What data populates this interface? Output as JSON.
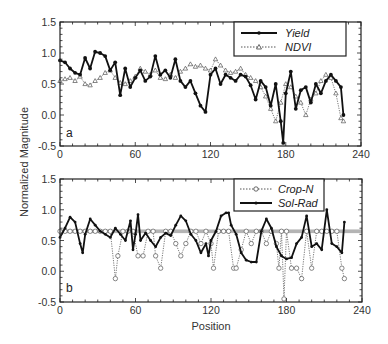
{
  "figure": {
    "ylabel": "Normalized Magnitude",
    "xlabel": "Position"
  },
  "chart_data": [
    {
      "type": "line",
      "panel_label": "a",
      "xlabel": "",
      "ylabel": "Normalized Magnitude",
      "xlim": [
        0,
        240
      ],
      "ylim": [
        -0.5,
        1.5
      ],
      "xticks": [
        "0",
        "60",
        "120",
        "180",
        "240"
      ],
      "yticks": [
        "1.5",
        "1.0",
        "0.5",
        "0.0",
        "-0.5"
      ],
      "grid": false,
      "legend_position": "upper right",
      "series": [
        {
          "name": "Yield",
          "style": "solid",
          "marker": "filled-circle",
          "color": "#111111",
          "x": [
            0,
            4,
            8,
            12,
            16,
            20,
            24,
            28,
            32,
            36,
            40,
            44,
            48,
            52,
            56,
            60,
            64,
            68,
            72,
            76,
            80,
            84,
            88,
            92,
            96,
            100,
            104,
            108,
            112,
            116,
            120,
            124,
            128,
            132,
            136,
            140,
            144,
            148,
            152,
            156,
            160,
            164,
            168,
            172,
            176,
            178,
            180,
            184,
            188,
            192,
            196,
            200,
            204,
            208,
            212,
            216,
            220,
            224,
            226
          ],
          "values": [
            0.88,
            0.85,
            0.75,
            0.68,
            0.65,
            0.92,
            0.75,
            1.02,
            1.0,
            0.95,
            0.72,
            0.85,
            0.32,
            0.75,
            0.45,
            0.6,
            0.72,
            0.55,
            0.62,
            0.95,
            0.65,
            0.72,
            0.6,
            0.9,
            0.55,
            0.45,
            0.55,
            0.35,
            0.15,
            0.05,
            0.65,
            0.75,
            0.5,
            0.65,
            0.6,
            0.55,
            0.65,
            0.62,
            0.48,
            0.25,
            0.55,
            0.45,
            0.15,
            0.5,
            -0.1,
            -0.45,
            0.35,
            0.7,
            0.1,
            0.4,
            0.45,
            0.2,
            0.5,
            0.35,
            0.55,
            0.65,
            0.55,
            0.45,
            0.0
          ]
        },
        {
          "name": "NDVI",
          "style": "dotted",
          "marker": "open-triangle",
          "color": "#555555",
          "x": [
            0,
            4,
            8,
            12,
            16,
            20,
            24,
            28,
            32,
            36,
            40,
            44,
            48,
            52,
            56,
            60,
            64,
            68,
            72,
            76,
            80,
            84,
            88,
            92,
            96,
            100,
            104,
            108,
            112,
            116,
            120,
            124,
            128,
            132,
            136,
            140,
            144,
            148,
            152,
            156,
            160,
            164,
            168,
            172,
            176,
            180,
            184,
            188,
            192,
            196,
            200,
            204,
            208,
            212,
            216,
            220,
            224,
            226
          ],
          "values": [
            0.55,
            0.58,
            0.6,
            0.55,
            0.62,
            0.5,
            0.48,
            0.55,
            0.6,
            0.68,
            0.72,
            0.6,
            0.52,
            0.5,
            0.55,
            0.62,
            0.75,
            0.7,
            0.65,
            0.72,
            0.6,
            0.58,
            0.65,
            0.6,
            0.7,
            0.75,
            0.82,
            0.78,
            0.8,
            0.75,
            0.72,
            0.9,
            0.8,
            0.72,
            0.68,
            0.7,
            0.75,
            0.65,
            0.6,
            0.55,
            0.45,
            0.3,
            0.1,
            -0.1,
            0.2,
            0.5,
            0.45,
            0.3,
            0.2,
            0.0,
            0.25,
            0.35,
            0.55,
            0.65,
            0.6,
            0.35,
            -0.05,
            -0.1
          ]
        }
      ]
    },
    {
      "type": "line",
      "panel_label": "b",
      "xlabel": "Position",
      "ylabel": "Normalized Magnitude",
      "xlim": [
        0,
        240
      ],
      "ylim": [
        -0.5,
        1.5
      ],
      "xticks": [
        "0",
        "60",
        "120",
        "180",
        "240"
      ],
      "yticks": [
        "1.5",
        "1.0",
        "0.5",
        "0.0",
        "-0.5"
      ],
      "grid": false,
      "legend_position": "upper right",
      "series": [
        {
          "name": "Crop-N",
          "style": "dotted",
          "marker": "open-circle",
          "color": "#555555",
          "x": [
            0,
            4,
            8,
            12,
            16,
            20,
            24,
            28,
            32,
            36,
            40,
            44,
            46,
            50,
            54,
            58,
            62,
            66,
            70,
            74,
            76,
            80,
            84,
            88,
            92,
            96,
            100,
            104,
            108,
            112,
            116,
            120,
            122,
            126,
            130,
            134,
            138,
            140,
            144,
            148,
            152,
            156,
            160,
            164,
            168,
            172,
            174,
            176,
            178,
            180,
            184,
            188,
            192,
            196,
            200,
            204,
            208,
            212,
            216,
            220,
            224,
            226
          ],
          "values": [
            0.65,
            0.65,
            0.65,
            0.65,
            0.65,
            0.65,
            0.65,
            0.65,
            0.65,
            0.65,
            0.65,
            -0.12,
            0.25,
            0.65,
            0.65,
            0.65,
            0.25,
            0.25,
            0.65,
            0.65,
            0.25,
            0.05,
            0.65,
            0.65,
            0.45,
            0.25,
            0.45,
            0.65,
            0.65,
            0.45,
            0.65,
            0.45,
            0.05,
            0.65,
            0.65,
            0.65,
            0.05,
            0.05,
            0.35,
            0.65,
            0.45,
            0.65,
            0.65,
            0.45,
            0.65,
            0.45,
            0.05,
            0.65,
            -0.45,
            0.65,
            0.05,
            0.05,
            -0.12,
            0.65,
            0.05,
            0.65,
            0.65,
            0.65,
            0.65,
            0.65,
            0.05,
            -0.12
          ]
        },
        {
          "name": "Sol-Rad",
          "style": "solid",
          "marker": "small-filled",
          "color": "#111111",
          "x": [
            0,
            4,
            8,
            12,
            16,
            18,
            20,
            24,
            28,
            32,
            36,
            40,
            44,
            48,
            52,
            56,
            58,
            60,
            62,
            64,
            68,
            72,
            76,
            80,
            84,
            88,
            92,
            96,
            100,
            104,
            108,
            112,
            116,
            118,
            120,
            124,
            128,
            132,
            134,
            136,
            140,
            144,
            148,
            152,
            156,
            160,
            164,
            168,
            172,
            176,
            180,
            184,
            188,
            192,
            196,
            200,
            204,
            208,
            212,
            216,
            220,
            224,
            226
          ],
          "values": [
            0.55,
            0.7,
            0.88,
            0.8,
            0.45,
            0.3,
            0.6,
            0.85,
            0.75,
            0.65,
            0.6,
            0.55,
            0.7,
            0.6,
            0.5,
            0.82,
            0.35,
            0.6,
            0.92,
            0.5,
            0.62,
            0.5,
            0.4,
            0.55,
            0.62,
            0.58,
            0.75,
            0.9,
            0.82,
            0.6,
            0.5,
            0.3,
            0.45,
            0.25,
            0.5,
            0.65,
            0.9,
            0.95,
            0.95,
            0.75,
            0.6,
            0.3,
            0.18,
            0.15,
            0.15,
            0.65,
            0.85,
            0.7,
            0.4,
            0.25,
            0.2,
            0.22,
            0.45,
            0.55,
            0.9,
            0.4,
            0.45,
            0.35,
            1.0,
            0.45,
            0.4,
            0.3,
            0.8
          ]
        }
      ]
    }
  ]
}
